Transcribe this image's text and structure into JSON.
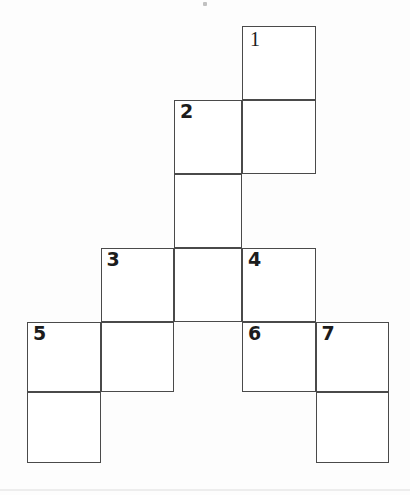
{
  "figure": {
    "kind": "crossword-grid",
    "title": "",
    "background_color": "#fdfdfd",
    "cell_fill_color": "#ffffff",
    "line_color": "#4a4a4a",
    "number_color": "#1c1c1c",
    "line_width_px": 1.6,
    "cell_width_px": 73.5,
    "cell_height_px": 74
  },
  "geometry": {
    "column_x": [
      27,
      100.5,
      174,
      242,
      315.5,
      389
    ],
    "row_y": [
      26,
      100,
      174,
      248,
      322,
      392,
      463
    ],
    "columns": 5,
    "rows": 6
  },
  "cells": [
    {
      "name": "cell-r0c3",
      "row": 0,
      "col": 3,
      "number": "1",
      "has_number": true
    },
    {
      "name": "cell-r1c2",
      "row": 1,
      "col": 2,
      "number": "2",
      "has_number": true
    },
    {
      "name": "cell-r1c3",
      "row": 1,
      "col": 3,
      "number": "",
      "has_number": false
    },
    {
      "name": "cell-r2c2",
      "row": 2,
      "col": 2,
      "number": "",
      "has_number": false
    },
    {
      "name": "cell-r3c1",
      "row": 3,
      "col": 1,
      "number": "3",
      "has_number": true
    },
    {
      "name": "cell-r3c2",
      "row": 3,
      "col": 2,
      "number": "",
      "has_number": false
    },
    {
      "name": "cell-r3c3",
      "row": 3,
      "col": 3,
      "number": "4",
      "has_number": true
    },
    {
      "name": "cell-r4c0",
      "row": 4,
      "col": 0,
      "number": "5",
      "has_number": true
    },
    {
      "name": "cell-r4c1",
      "row": 4,
      "col": 1,
      "number": "",
      "has_number": false
    },
    {
      "name": "cell-r4c3",
      "row": 4,
      "col": 3,
      "number": "6",
      "has_number": true
    },
    {
      "name": "cell-r4c4",
      "row": 4,
      "col": 4,
      "number": "7",
      "has_number": true
    },
    {
      "name": "cell-r5c0",
      "row": 5,
      "col": 0,
      "number": "",
      "has_number": false
    },
    {
      "name": "cell-r5c4",
      "row": 5,
      "col": 4,
      "number": "",
      "has_number": false
    }
  ],
  "clue_numbers": [
    "1",
    "2",
    "3",
    "4",
    "5",
    "6",
    "7"
  ],
  "artifacts": [
    {
      "name": "scan-speck-top",
      "x": 203,
      "y": 2,
      "w": 4,
      "h": 4
    },
    {
      "name": "scan-edge-smudge-bottom",
      "x": 0,
      "y": 489,
      "w": 410,
      "h": 2
    }
  ]
}
